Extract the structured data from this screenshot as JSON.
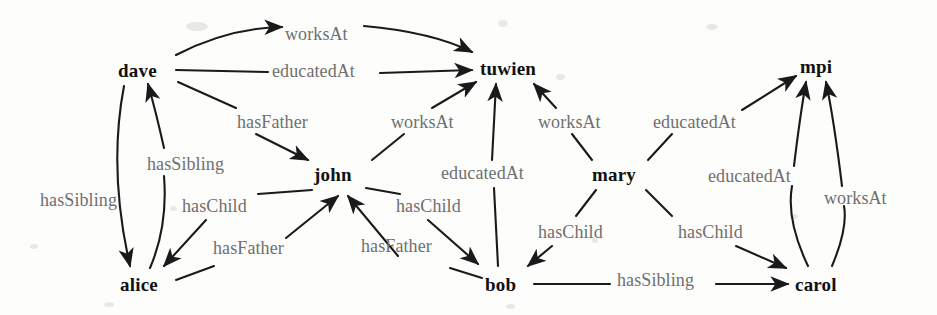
{
  "figure": {
    "type": "knowledge-graph-diagram",
    "background_color": "#fdfdfc",
    "node_color": "#111111",
    "edge_label_color": "#6f6f6f",
    "edge_color": "#1a1a1a"
  },
  "nodes": [
    {
      "id": "dave",
      "label": "dave",
      "x": 118,
      "y": 60
    },
    {
      "id": "tuwien",
      "label": "tuwien",
      "x": 480,
      "y": 58
    },
    {
      "id": "mpi",
      "label": "mpi",
      "x": 800,
      "y": 56
    },
    {
      "id": "john",
      "label": "john",
      "x": 314,
      "y": 164
    },
    {
      "id": "mary",
      "label": "mary",
      "x": 592,
      "y": 164
    },
    {
      "id": "alice",
      "label": "alice",
      "x": 120,
      "y": 274
    },
    {
      "id": "bob",
      "label": "bob",
      "x": 485,
      "y": 274
    },
    {
      "id": "carol",
      "label": "carol",
      "x": 795,
      "y": 274
    }
  ],
  "edges": [
    {
      "id": "dave-worksAt-tuwien",
      "source": "dave",
      "target": "tuwien",
      "label": "worksAt",
      "label_x": 285,
      "label_y": 24
    },
    {
      "id": "dave-educatedAt-tuwien",
      "source": "dave",
      "target": "tuwien",
      "label": "educatedAt",
      "label_x": 272,
      "label_y": 61
    },
    {
      "id": "dave-hasFather-john",
      "source": "dave",
      "target": "john",
      "label": "hasFather",
      "label_x": 237,
      "label_y": 112
    },
    {
      "id": "john-worksAt-tuwien",
      "source": "john",
      "target": "tuwien",
      "label": "worksAt",
      "label_x": 391,
      "label_y": 112
    },
    {
      "id": "mary-worksAt-tuwien",
      "source": "mary",
      "target": "tuwien",
      "label": "worksAt",
      "label_x": 538,
      "label_y": 112
    },
    {
      "id": "mary-educatedAt-mpi",
      "source": "mary",
      "target": "mpi",
      "label": "educatedAt",
      "label_x": 653,
      "label_y": 112
    },
    {
      "id": "dave-hasSibling-alice",
      "source": "dave",
      "target": "alice",
      "label": "hasSibling",
      "label_x": 147,
      "label_y": 154
    },
    {
      "id": "alice-hasSibling-dave",
      "source": "alice",
      "target": "dave",
      "label": "hasSibling",
      "label_x": 40,
      "label_y": 190
    },
    {
      "id": "john-hasChild-alice",
      "source": "john",
      "target": "alice",
      "label": "hasChild",
      "label_x": 182,
      "label_y": 196
    },
    {
      "id": "alice-hasFather-john",
      "source": "alice",
      "target": "john",
      "label": "hasFather",
      "label_x": 213,
      "label_y": 238
    },
    {
      "id": "bob-educatedAt-tuwien",
      "source": "bob",
      "target": "tuwien",
      "label": "educatedAt",
      "label_x": 441,
      "label_y": 163
    },
    {
      "id": "john-hasChild-bob",
      "source": "john",
      "target": "bob",
      "label": "hasChild",
      "label_x": 396,
      "label_y": 196
    },
    {
      "id": "bob-hasFather-john",
      "source": "bob",
      "target": "john",
      "label": "hasFather",
      "label_x": 361,
      "label_y": 236
    },
    {
      "id": "mary-hasChild-bob",
      "source": "mary",
      "target": "bob",
      "label": "hasChild",
      "label_x": 538,
      "label_y": 222
    },
    {
      "id": "mary-hasChild-carol",
      "source": "mary",
      "target": "carol",
      "label": "hasChild",
      "label_x": 678,
      "label_y": 222
    },
    {
      "id": "carol-educatedAt-mpi",
      "source": "carol",
      "target": "mpi",
      "label": "educatedAt",
      "label_x": 708,
      "label_y": 166
    },
    {
      "id": "carol-worksAt-mpi",
      "source": "carol",
      "target": "mpi",
      "label": "worksAt",
      "label_x": 824,
      "label_y": 188
    },
    {
      "id": "bob-hasSibling-carol",
      "source": "bob",
      "target": "carol",
      "label": "hasSibling",
      "label_x": 617,
      "label_y": 270
    }
  ]
}
